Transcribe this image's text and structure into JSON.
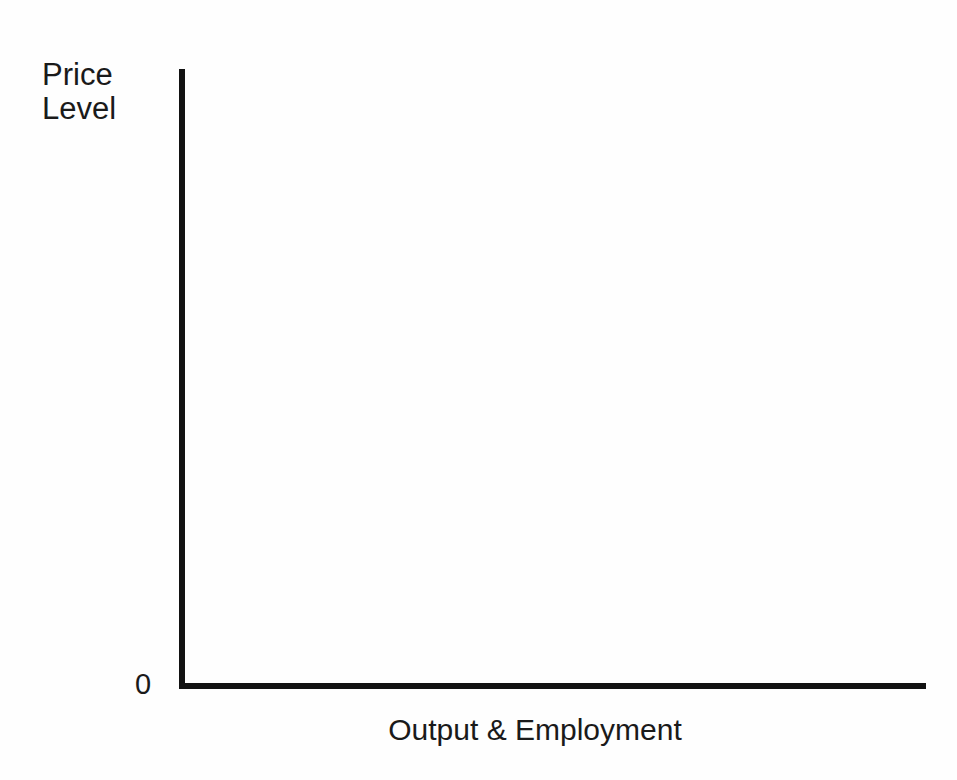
{
  "figure": {
    "background_color": "#fefefe",
    "ink_color": "#121212",
    "text_color": "#1a1a1a",
    "origin_label": "0"
  },
  "axes": {
    "y_axis_label": "Price\nLevel",
    "y_axis_label_line1": "Price",
    "y_axis_label_line2": "Level",
    "x_axis_label": "Output & Employment"
  },
  "scan_noise": {
    "mark_1": "",
    "mark_2": "",
    "mark_3": "",
    "mark_4": "",
    "mark_5": ""
  },
  "chart_data": {
    "type": "line",
    "title": "",
    "subtitle": "",
    "xlabel": "Output & Employment",
    "ylabel": "Price Level",
    "origin_label": "0",
    "series": [],
    "x": [],
    "categories": [],
    "values": [],
    "annotations": [],
    "legend": [],
    "legend_position": "none",
    "grid": false,
    "xlim": [
      0,
      1
    ],
    "ylim": [
      0,
      1
    ],
    "x_tick_labels": [],
    "y_tick_labels": []
  }
}
